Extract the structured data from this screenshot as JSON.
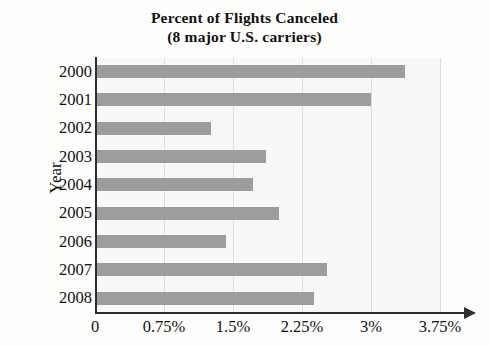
{
  "chart_data": {
    "type": "bar",
    "orientation": "horizontal",
    "title": "Percent of Flights Canceled",
    "subtitle": "(8 major U.S. carriers)",
    "xlabel": "",
    "ylabel": "Year",
    "categories": [
      "2000",
      "2001",
      "2002",
      "2003",
      "2004",
      "2005",
      "2006",
      "2007",
      "2008"
    ],
    "values": [
      3.37,
      3.0,
      1.26,
      1.86,
      1.72,
      2.0,
      1.42,
      2.52,
      2.38
    ],
    "xticks": [
      0,
      0.75,
      1.5,
      2.25,
      3,
      3.75
    ],
    "xtick_labels": [
      "0",
      "0.75%",
      "1.5%",
      "2.25%",
      "3%",
      "3.75%"
    ],
    "xlim": [
      0,
      3.75
    ],
    "grid": true,
    "grid_axis": "x",
    "legend": "none",
    "colors": {
      "bar": "#9d9d9d",
      "gridline": "#dcdcdc",
      "axis": "#2e2e2e",
      "plot_background": "#f8f8f6",
      "text": "#111111"
    }
  }
}
